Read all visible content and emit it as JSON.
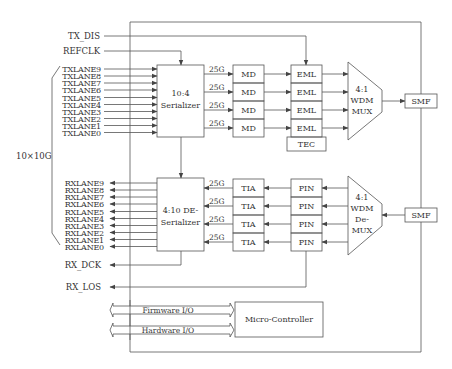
{
  "colors": {
    "line": "#555555",
    "text": "#333333",
    "background": "#ffffff"
  },
  "signals": {
    "tx_dis": "TX_DIS",
    "refclk": "REFCLK",
    "rx_dck": "RX_DCK",
    "rx_los": "RX_LOS",
    "bus_width": "10×10G"
  },
  "tx": {
    "lanes": [
      "TXLANE9",
      "TXLANE8",
      "TXLANE7",
      "TXLANE6",
      "TXLANE5",
      "TXLANE4",
      "TXLANE3",
      "TXLANE2",
      "TXLANE1",
      "TXLANE0"
    ],
    "serializer": {
      "line1": "10:4",
      "line2": "Serializer"
    },
    "rate_labels": [
      "25G",
      "25G",
      "25G",
      "25G"
    ],
    "md": [
      "MD",
      "MD",
      "MD",
      "MD"
    ],
    "eml": [
      "EML",
      "EML",
      "EML",
      "EML"
    ],
    "tec": "TEC",
    "mux": {
      "line1": "4:1",
      "line2": "WDM",
      "line3": "MUX"
    },
    "smf": "SMF"
  },
  "rx": {
    "lanes": [
      "RXLANE9",
      "RXLANE8",
      "RXLANE7",
      "RXLANE6",
      "RXLANE5",
      "RXLANE4",
      "RXLANE3",
      "RXLANE2",
      "RXLANE1",
      "RXLANE0"
    ],
    "deserializer": {
      "line1": "4:10 DE-",
      "line2": "Serializer"
    },
    "rate_labels": [
      "25G",
      "25G",
      "25G",
      "25G"
    ],
    "tia": [
      "TIA",
      "TIA",
      "TIA",
      "TIA"
    ],
    "pin": [
      "PIN",
      "PIN",
      "PIN",
      "PIN"
    ],
    "demux": {
      "line1": "4:1",
      "line2": "WDM",
      "line3": "De-",
      "line4": "MUX"
    },
    "smf": "SMF"
  },
  "control": {
    "firmware_io": "Firmware I/O",
    "hardware_io": "Hardware I/O",
    "micro_controller": "Micro-Controller"
  }
}
